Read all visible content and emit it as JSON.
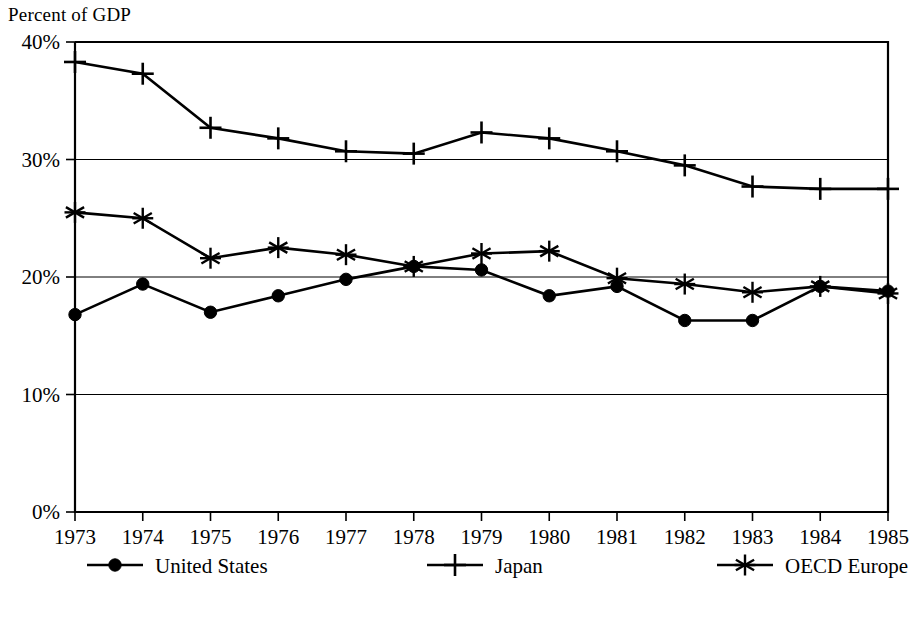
{
  "chart_data": {
    "type": "line",
    "title": "",
    "ylabel": "Percent of GDP",
    "xlabel": "",
    "grid": true,
    "legend_position": "bottom",
    "ylim": [
      0,
      40
    ],
    "ytick_labels": [
      "0%",
      "10%",
      "20%",
      "30%",
      "40%"
    ],
    "ytick_values": [
      0,
      10,
      20,
      30,
      40
    ],
    "categories": [
      "1973",
      "1974",
      "1975",
      "1976",
      "1977",
      "1978",
      "1979",
      "1980",
      "1981",
      "1982",
      "1983",
      "1984",
      "1985"
    ],
    "x": [
      1973,
      1974,
      1975,
      1976,
      1977,
      1978,
      1979,
      1980,
      1981,
      1982,
      1983,
      1984,
      1985
    ],
    "series": [
      {
        "name": "United States",
        "marker": "filled-circle",
        "values": [
          16.8,
          19.4,
          17.0,
          18.4,
          19.8,
          20.9,
          20.6,
          18.4,
          19.2,
          16.3,
          16.3,
          19.2,
          18.8
        ]
      },
      {
        "name": "Japan",
        "marker": "plus-cross",
        "values": [
          38.3,
          37.3,
          32.7,
          31.8,
          30.7,
          30.5,
          32.3,
          31.8,
          30.7,
          29.5,
          27.7,
          27.5,
          27.5
        ]
      },
      {
        "name": "OECD Europe",
        "marker": "asterisk-star",
        "values": [
          25.5,
          25.0,
          21.6,
          22.5,
          21.9,
          20.9,
          22.0,
          22.2,
          19.9,
          19.4,
          18.7,
          19.2,
          18.6
        ]
      }
    ],
    "colors": {
      "line": "#000000",
      "grid": "#000000",
      "background": "#ffffff"
    }
  },
  "axis": {
    "y_title": "Percent of GDP"
  },
  "legend": {
    "items": [
      {
        "label": "United States",
        "marker": "filled-circle"
      },
      {
        "label": "Japan",
        "marker": "plus-cross"
      },
      {
        "label": "OECD Europe",
        "marker": "asterisk-star"
      }
    ]
  }
}
